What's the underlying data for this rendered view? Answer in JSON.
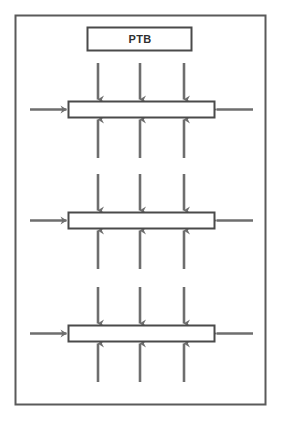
{
  "diagram": {
    "title_box": {
      "label": "PTB",
      "x": 87,
      "y": 27,
      "width": 105,
      "height": 24
    },
    "frame": {
      "x": 15,
      "y": 15,
      "width": 251,
      "height": 390,
      "stroke_color": "#5a5a5a",
      "fill_color": "#ffffff"
    },
    "colors": {
      "outline": "#4a4a4a",
      "arrow": "#6e6e6e",
      "bar_fill": "#ffffff",
      "label_text": "#2f2f2f",
      "page_background": "#ffffff"
    },
    "bar_geometry": {
      "x": 68,
      "width": 147,
      "height": 17
    },
    "arrow_columns_x": [
      98,
      140,
      184
    ],
    "bars": [
      {
        "name": "bar-1",
        "y": 101,
        "top_arrows": {
          "direction": "down",
          "count": 3,
          "length": 38,
          "label": "downward-load-arrows"
        },
        "bottom_arrows": {
          "direction": "up",
          "count": 3,
          "length": 40,
          "label": "upward-reaction-arrows"
        },
        "left_arrow": {
          "direction": "right",
          "length": 38,
          "label": "left-inward-arrow"
        },
        "right_arrow": {
          "direction": "left",
          "length": 38,
          "label": "right-inward-arrow"
        }
      },
      {
        "name": "bar-2",
        "y": 212,
        "top_arrows": {
          "direction": "down",
          "count": 3,
          "length": 38,
          "label": "downward-load-arrows"
        },
        "bottom_arrows": {
          "direction": "up",
          "count": 3,
          "length": 40,
          "label": "upward-reaction-arrows"
        },
        "left_arrow": {
          "direction": "right",
          "length": 38,
          "label": "left-inward-arrow"
        },
        "right_arrow": {
          "direction": "left",
          "length": 38,
          "label": "right-inward-arrow"
        }
      },
      {
        "name": "bar-3",
        "y": 325,
        "top_arrows": {
          "direction": "down",
          "count": 3,
          "length": 38,
          "label": "downward-load-arrows"
        },
        "bottom_arrows": {
          "direction": "up",
          "count": 3,
          "length": 40,
          "label": "upward-reaction-arrows"
        },
        "left_arrow": {
          "direction": "right",
          "length": 38,
          "label": "left-inward-arrow"
        },
        "right_arrow": {
          "direction": "left",
          "length": 38,
          "label": "right-inward-arrow"
        }
      }
    ]
  }
}
